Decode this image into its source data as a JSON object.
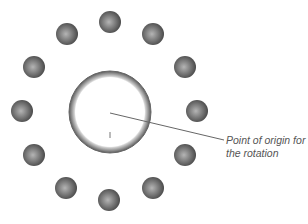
{
  "diagram": {
    "title_cutoff": "",
    "center": {
      "x": 110,
      "y": 112
    },
    "ring": {
      "outer_radius": 41,
      "inner_radius": 35,
      "color": "#777777"
    },
    "ball_radius": 11,
    "balls": [
      {
        "x": 110,
        "y": 22
      },
      {
        "x": 153,
        "y": 34
      },
      {
        "x": 185,
        "y": 67
      },
      {
        "x": 197,
        "y": 111
      },
      {
        "x": 185,
        "y": 155
      },
      {
        "x": 153,
        "y": 188
      },
      {
        "x": 109,
        "y": 200
      },
      {
        "x": 66,
        "y": 188
      },
      {
        "x": 34,
        "y": 155
      },
      {
        "x": 22,
        "y": 111
      },
      {
        "x": 34,
        "y": 67
      },
      {
        "x": 67,
        "y": 34
      }
    ],
    "pointer": {
      "from": {
        "x": 110,
        "y": 113
      },
      "to": {
        "x": 224,
        "y": 140
      }
    },
    "label_lines": [
      "Point of origin for",
      "the rotation"
    ]
  }
}
